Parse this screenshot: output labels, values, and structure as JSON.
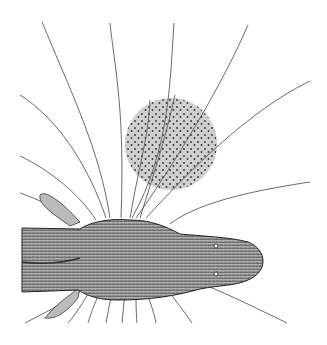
{
  "figure": {
    "subject": "Electric fish with field lines",
    "elements": {
      "fish": {
        "label": "fish-body",
        "fill": "#9a9a9a",
        "outline": "#222222"
      },
      "object": {
        "label": "conductive-sphere",
        "fill": "#cccccc",
        "dot_color": "#333333",
        "cx": 171,
        "cy": 144,
        "r": 46
      },
      "field_lines": {
        "color": "#555555",
        "count_above": 12,
        "count_below": 10
      }
    },
    "colors": {
      "background": "#ffffff",
      "line": "#5a5a5a",
      "sphere": "#cfcfcf",
      "fish_dark": "#3a3a3a",
      "fish_light": "#e8e8e8"
    }
  }
}
